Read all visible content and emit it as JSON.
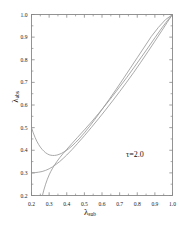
{
  "figure": {
    "background": "#ffffff",
    "axis_color": "#888888",
    "curve_color": "#999999",
    "annotation": "τ=2.0",
    "xlabel_symbol": "λ",
    "xlabel_sub": "sub",
    "ylabel_symbol": "λ",
    "ylabel_sub": "abs"
  },
  "chart_data": {
    "type": "line",
    "title": "",
    "xlabel": "λ_sub",
    "ylabel": "λ_abs",
    "xlim": [
      0.2,
      1.0
    ],
    "ylim": [
      0.2,
      1.0
    ],
    "xticks": [
      "0.2",
      "0.3",
      "0.4",
      "0.5",
      "0.6",
      "0.7",
      "0.8",
      "0.9",
      "1.0"
    ],
    "yticks": [
      "0.2",
      "0.3",
      "0.4",
      "0.5",
      "0.6",
      "0.7",
      "0.8",
      "0.9",
      "1.0"
    ],
    "xtick_values": [
      0.2,
      0.3,
      0.4,
      0.5,
      0.6,
      0.7,
      0.8,
      0.9,
      1.0
    ],
    "ytick_values": [
      0.2,
      0.3,
      0.4,
      0.5,
      0.6,
      0.7,
      0.8,
      0.9,
      1.0
    ],
    "grid": false,
    "legend": "none",
    "annotations": [
      {
        "text": "τ=2.0",
        "x": 0.78,
        "y": 0.365
      }
    ],
    "series": [
      {
        "name": "upper-branch",
        "comment": "starts high at left edge, dips to a minimum near x=0.33, then rises to (1,1)",
        "points": [
          [
            0.2,
            0.5
          ],
          [
            0.21,
            0.477
          ],
          [
            0.22,
            0.457
          ],
          [
            0.23,
            0.44
          ],
          [
            0.24,
            0.426
          ],
          [
            0.25,
            0.414
          ],
          [
            0.26,
            0.404
          ],
          [
            0.27,
            0.396
          ],
          [
            0.28,
            0.389
          ],
          [
            0.29,
            0.384
          ],
          [
            0.3,
            0.38
          ],
          [
            0.31,
            0.378
          ],
          [
            0.32,
            0.377
          ],
          [
            0.33,
            0.377
          ],
          [
            0.34,
            0.378
          ],
          [
            0.35,
            0.38
          ],
          [
            0.37,
            0.386
          ],
          [
            0.39,
            0.395
          ],
          [
            0.41,
            0.406
          ],
          [
            0.43,
            0.419
          ],
          [
            0.45,
            0.434
          ],
          [
            0.47,
            0.45
          ],
          [
            0.5,
            0.477
          ],
          [
            0.53,
            0.506
          ],
          [
            0.56,
            0.537
          ],
          [
            0.6,
            0.58
          ],
          [
            0.64,
            0.624
          ],
          [
            0.68,
            0.669
          ],
          [
            0.72,
            0.715
          ],
          [
            0.76,
            0.762
          ],
          [
            0.8,
            0.809
          ],
          [
            0.84,
            0.856
          ],
          [
            0.88,
            0.903
          ],
          [
            0.92,
            0.943
          ],
          [
            0.96,
            0.977
          ],
          [
            1.0,
            1.0
          ]
        ]
      },
      {
        "name": "middle-branch",
        "comment": "flat near 0.30 at left edge, rises monotonically to (1,1)",
        "points": [
          [
            0.2,
            0.3
          ],
          [
            0.22,
            0.301
          ],
          [
            0.24,
            0.303
          ],
          [
            0.26,
            0.306
          ],
          [
            0.28,
            0.311
          ],
          [
            0.3,
            0.318
          ],
          [
            0.32,
            0.327
          ],
          [
            0.34,
            0.338
          ],
          [
            0.36,
            0.35
          ],
          [
            0.38,
            0.364
          ],
          [
            0.4,
            0.379
          ],
          [
            0.43,
            0.403
          ],
          [
            0.46,
            0.429
          ],
          [
            0.5,
            0.464
          ],
          [
            0.54,
            0.501
          ],
          [
            0.58,
            0.539
          ],
          [
            0.62,
            0.578
          ],
          [
            0.66,
            0.618
          ],
          [
            0.7,
            0.659
          ],
          [
            0.74,
            0.701
          ],
          [
            0.78,
            0.744
          ],
          [
            0.82,
            0.789
          ],
          [
            0.86,
            0.835
          ],
          [
            0.9,
            0.882
          ],
          [
            0.94,
            0.929
          ],
          [
            0.97,
            0.965
          ],
          [
            1.0,
            1.0
          ]
        ]
      },
      {
        "name": "lower-branch",
        "comment": "rises steeply from the bottom axis at x~0.26 up to (1,1)",
        "points": [
          [
            0.262,
            0.2
          ],
          [
            0.27,
            0.224
          ],
          [
            0.28,
            0.25
          ],
          [
            0.29,
            0.272
          ],
          [
            0.3,
            0.291
          ],
          [
            0.31,
            0.307
          ],
          [
            0.32,
            0.321
          ],
          [
            0.33,
            0.334
          ],
          [
            0.345,
            0.351
          ],
          [
            0.36,
            0.367
          ],
          [
            0.38,
            0.386
          ],
          [
            0.4,
            0.404
          ],
          [
            0.43,
            0.43
          ],
          [
            0.46,
            0.456
          ],
          [
            0.5,
            0.49
          ],
          [
            0.54,
            0.525
          ],
          [
            0.58,
            0.562
          ],
          [
            0.62,
            0.6
          ],
          [
            0.66,
            0.639
          ],
          [
            0.7,
            0.68
          ],
          [
            0.74,
            0.721
          ],
          [
            0.78,
            0.764
          ],
          [
            0.82,
            0.808
          ],
          [
            0.86,
            0.852
          ],
          [
            0.9,
            0.897
          ],
          [
            0.94,
            0.941
          ],
          [
            0.97,
            0.972
          ],
          [
            1.0,
            1.0
          ]
        ]
      }
    ]
  }
}
